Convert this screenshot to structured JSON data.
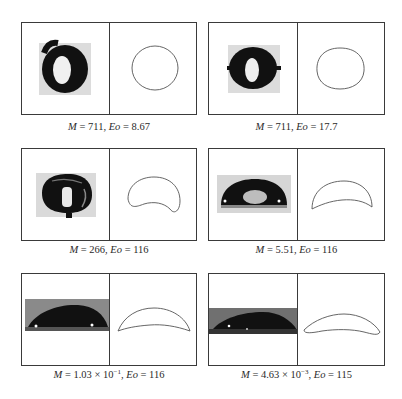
{
  "figure": {
    "panels": [
      {
        "id": "a",
        "M_label": "M",
        "M_value": "711",
        "Eo_label": "Eo",
        "Eo_value": "8.67",
        "caption": "M = 711, Eo = 8.67",
        "left_image": "experimental bubble photo (near-circular ring)",
        "right_image": "simulated bubble contour (circle)"
      },
      {
        "id": "b",
        "M_label": "M",
        "M_value": "711",
        "Eo_label": "Eo",
        "Eo_value": "17.7",
        "caption": "M = 711, Eo = 17.7",
        "left_image": "experimental bubble photo (ellipsoidal ring)",
        "right_image": "simulated bubble contour (ellipsoid)"
      },
      {
        "id": "c",
        "M_label": "M",
        "M_value": "266",
        "Eo_label": "Eo",
        "Eo_value": "116",
        "caption": "M = 266, Eo = 116",
        "left_image": "experimental bubble photo (dimpled ellipsoidal cap)",
        "right_image": "simulated bubble contour (dimpled ellipsoid)"
      },
      {
        "id": "d",
        "M_label": "M",
        "M_value": "5.51",
        "Eo_label": "Eo",
        "Eo_value": "116",
        "caption": "M = 5.51, Eo = 116",
        "left_image": "experimental bubble photo (spherical cap)",
        "right_image": "simulated bubble contour (crescent cap)"
      },
      {
        "id": "e",
        "M_label": "M",
        "M_mantissa": "1.03",
        "M_times": "×",
        "M_base": "10",
        "M_exponent": "−1",
        "Eo_label": "Eo",
        "Eo_value": "116",
        "caption": "M = 1.03 × 10⁻¹, Eo = 116",
        "left_image": "experimental bubble photo (flat spherical cap)",
        "right_image": "simulated bubble contour (thin cap)"
      },
      {
        "id": "f",
        "M_label": "M",
        "M_mantissa": "4.63",
        "M_times": "×",
        "M_base": "10",
        "M_exponent": "−3",
        "Eo_label": "Eo",
        "Eo_value": "115",
        "caption": "M = 4.63 × 10⁻³, Eo = 115",
        "left_image": "experimental bubble photo (skirted thin cap)",
        "right_image": "simulated bubble contour (thin skirted cap)"
      }
    ],
    "colors": {
      "frame": "#3a3a3a",
      "bubble_dark": "#111111",
      "contour": "#555555",
      "background": "#ffffff"
    }
  }
}
